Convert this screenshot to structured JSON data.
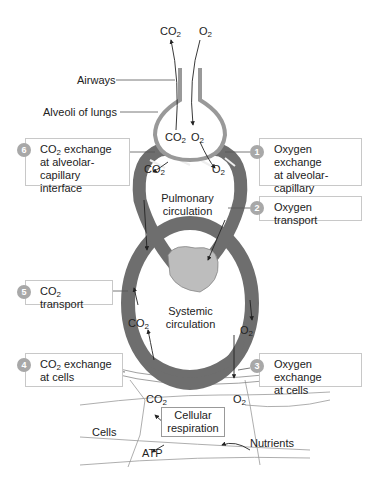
{
  "gases": {
    "co2": "CO",
    "o2": "O",
    "sub2": "2"
  },
  "labels": {
    "airways": "Airways",
    "alveoli": "Alveoli of lungs",
    "pulmonary_1": "Pulmonary",
    "pulmonary_2": "circulation",
    "systemic_1": "Systemic",
    "systemic_2": "circulation",
    "cells": "Cells",
    "cellular_1": "Cellular",
    "cellular_2": "respiration",
    "nutrients": "Nutrients",
    "atp": "ATP"
  },
  "steps": [
    {
      "number": "1",
      "lines": [
        "Oxygen exchange",
        "at alveolar-capillary",
        "interface"
      ]
    },
    {
      "number": "2",
      "lines": [
        "Oxygen transport"
      ]
    },
    {
      "number": "3",
      "lines": [
        "Oxygen exchange",
        "at cells"
      ]
    },
    {
      "number": "4",
      "lines": [
        "exchange",
        "at cells"
      ],
      "prefix": "CO"
    },
    {
      "number": "5",
      "lines": [
        "transport"
      ],
      "prefix": "CO"
    },
    {
      "number": "6",
      "lines": [
        "exchange",
        "at alveolar-capillary",
        "interface"
      ],
      "prefix": "CO"
    }
  ],
  "colors": {
    "vessel": "#6e6e6e",
    "vessel_light": "#9a9a9a",
    "badge": "#a8a8a8",
    "box_border": "#c8c8c8",
    "heart": "#bdbdbd"
  }
}
